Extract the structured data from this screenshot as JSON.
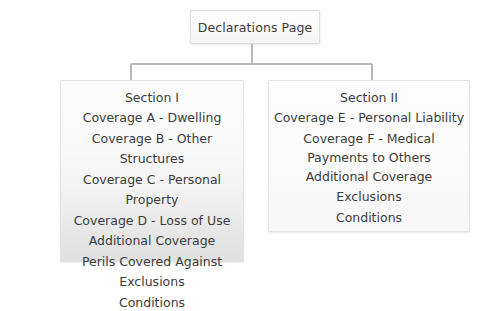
{
  "diagram": {
    "type": "org-chart",
    "root": {
      "label": "Declarations Page"
    },
    "branches": [
      {
        "id": "section-1",
        "title": "Section I",
        "items": [
          "Coverage A - Dwelling",
          "Coverage B - Other Structures",
          "Coverage C - Personal Property",
          "Coverage D - Loss of Use",
          "Additional Coverage",
          "Perils Covered Against",
          "Exclusions",
          "Conditions"
        ]
      },
      {
        "id": "section-2",
        "title": "Section II",
        "items": [
          "Coverage E - Personal Liability",
          "Coverage F - Medical Payments to Others",
          "Additional Coverage",
          "Exclusions",
          "Conditions"
        ]
      }
    ],
    "colors": {
      "background": "#ffffff",
      "text": "#3c3c3c",
      "border": "#e4e4e4",
      "connector": "#b9b9b9",
      "root_fill": "#fbfbfb"
    }
  }
}
